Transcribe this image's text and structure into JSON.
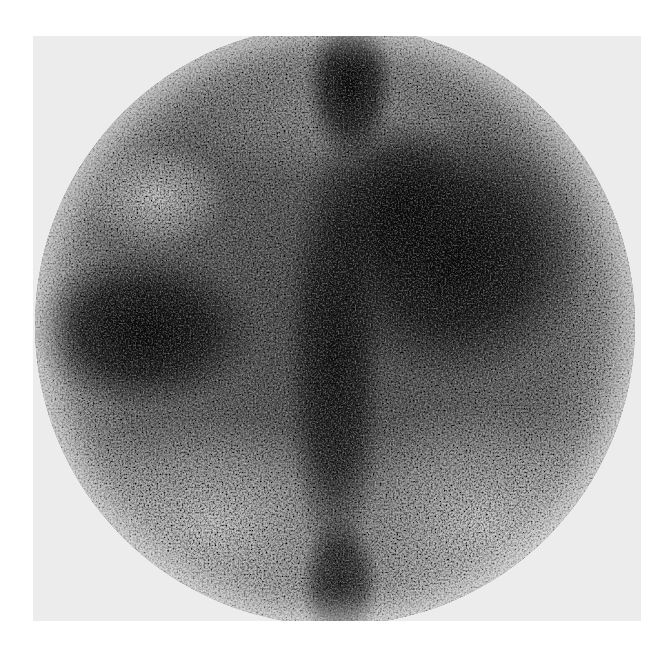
{
  "image": {
    "kind": "grayscale scintigraphy scan",
    "description": "Circular gamma-camera field of view showing mottled activity distribution with dark (high-uptake) regions in a light-gray square frame",
    "colors": {
      "page_background": "#ffffff",
      "frame_background": "#ececec",
      "darkest_uptake": "#0a0a0a",
      "mid_tone": "#7a7a7a",
      "light_region": "#c8c8c8"
    },
    "regions": [
      {
        "name": "upper-central-band",
        "tone": "dark"
      },
      {
        "name": "right-large-mass",
        "tone": "very dark"
      },
      {
        "name": "left-mass",
        "tone": "very dark"
      },
      {
        "name": "central-vertical-band",
        "tone": "dark"
      },
      {
        "name": "upper-left-blob",
        "tone": "light"
      },
      {
        "name": "lower-left-area",
        "tone": "light"
      },
      {
        "name": "lower-right-area",
        "tone": "light"
      }
    ]
  }
}
